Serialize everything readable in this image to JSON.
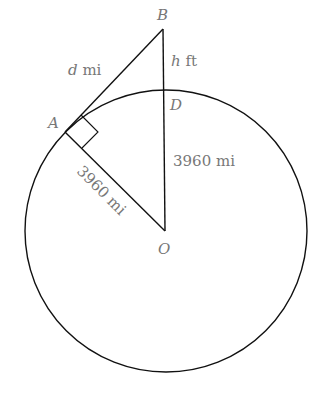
{
  "diagram": {
    "points": {
      "A": "A",
      "B": "B",
      "D": "D",
      "O": "O"
    },
    "labels": {
      "d_var": "d",
      "d_unit": " mi",
      "h_var": "h",
      "h_unit": " ft",
      "od": "3960 mi",
      "oa": "3960 mi"
    },
    "colors": {
      "stroke": "#111111",
      "label": "#777777"
    }
  }
}
